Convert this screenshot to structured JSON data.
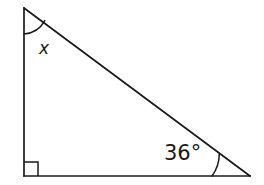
{
  "figure": {
    "type": "right-triangle-angle-diagram",
    "stroke_color": "#1a1a1a",
    "background_color": "#ffffff",
    "stroke_width": 1.6,
    "vertices": {
      "top": {
        "name": "A",
        "x": 24,
        "y": 8
      },
      "bottom_left": {
        "name": "B",
        "x": 24,
        "y": 176
      },
      "bottom_right": {
        "name": "C",
        "x": 250,
        "y": 176
      }
    },
    "edges": [
      {
        "name": "left-leg",
        "from": "A",
        "to": "B"
      },
      {
        "name": "bottom-leg",
        "from": "B",
        "to": "C"
      },
      {
        "name": "hypotenuse",
        "from": "A",
        "to": "C"
      }
    ],
    "angles": [
      {
        "name": "top-angle",
        "vertex": "A",
        "label": "x",
        "label_is_italic": true,
        "marker": "arc",
        "arc_radius": 26,
        "value_degrees": null
      },
      {
        "name": "bottom-left-angle",
        "vertex": "B",
        "label": "",
        "marker": "right-angle-square",
        "square_size": 14,
        "value_degrees": 90
      },
      {
        "name": "bottom-right-angle",
        "vertex": "C",
        "label": "36°",
        "marker": "arc",
        "arc_radius": 38,
        "value_degrees": 36
      }
    ]
  },
  "labels": {
    "top_angle": "x",
    "bottom_right_angle": "36°"
  }
}
